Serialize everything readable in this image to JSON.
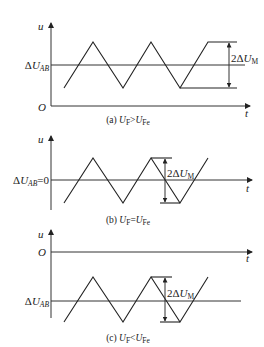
{
  "figure": {
    "axis_labels": {
      "y": "u",
      "x": "t",
      "origin": "O"
    },
    "amplitude_label": {
      "prefix": "2Δ",
      "var": "U",
      "sub": "M"
    },
    "panels": [
      {
        "id": "a",
        "baseline_label": {
          "prefix": "Δ",
          "var": "U",
          "sub": "AB",
          "suffix": ""
        },
        "caption": {
          "prefix": "(a) ",
          "left": "U",
          "left_sub": "F",
          "op": ">",
          "right": "U",
          "right_sub": "Fe"
        }
      },
      {
        "id": "b",
        "baseline_label": {
          "prefix": "Δ",
          "var": "U",
          "sub": "AB",
          "suffix": "=0"
        },
        "caption": {
          "prefix": "(b) ",
          "left": "U",
          "left_sub": "F",
          "op": "=",
          "right": "U",
          "right_sub": "Fe"
        }
      },
      {
        "id": "c",
        "baseline_label": {
          "prefix": "Δ",
          "var": "U",
          "sub": "AB",
          "suffix": ""
        },
        "caption": {
          "prefix": "(c) ",
          "left": "U",
          "left_sub": "F",
          "op": "<",
          "right": "U",
          "right_sub": "Fe"
        }
      }
    ]
  }
}
